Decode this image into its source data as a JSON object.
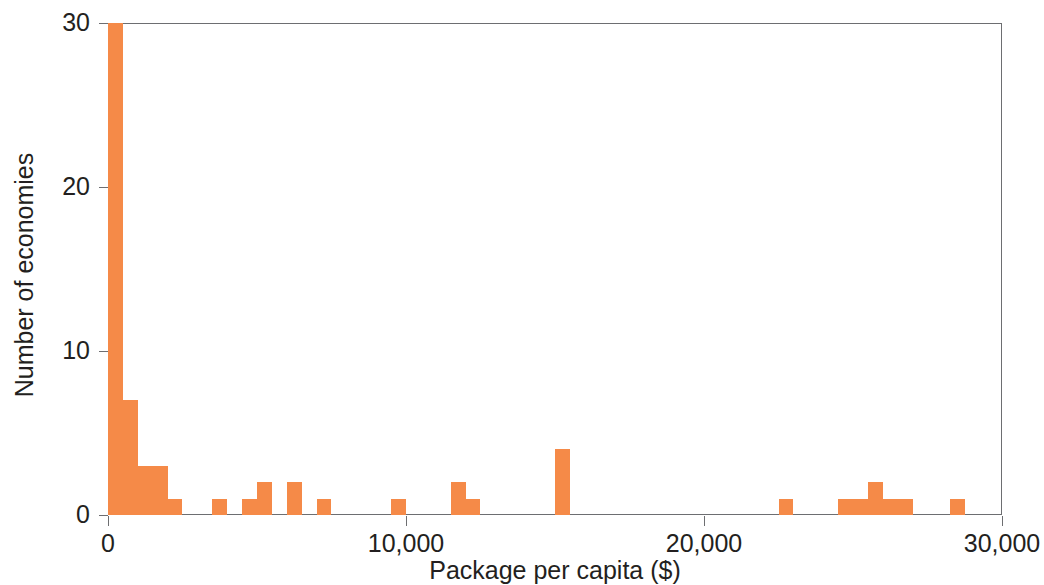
{
  "chart_data": {
    "type": "bar",
    "title": "",
    "subtitle": "",
    "xlabel": "Package per capita ($)",
    "ylabel": "Number of economies",
    "xlim": [
      0,
      30000
    ],
    "ylim": [
      0,
      30
    ],
    "xticks": [
      0,
      10000,
      20000,
      30000
    ],
    "xtick_labels": [
      "0",
      "10,000",
      "20,000",
      "30,000"
    ],
    "yticks": [
      0,
      10,
      20,
      30
    ],
    "ytick_labels": [
      "0",
      "10",
      "20",
      "30"
    ],
    "grid": false,
    "legend": null,
    "bin_width": 500,
    "bar_color": "#f58a48",
    "axis_color": "#6d6e71",
    "text_color": "#231f20",
    "background": "#ffffff",
    "note": "Histogram of economies by size of fiscal package per capita in US dollars; bins are 500 dollars wide.",
    "bins": [
      {
        "x0": 0,
        "x1": 500,
        "count": 30
      },
      {
        "x0": 500,
        "x1": 1000,
        "count": 7
      },
      {
        "x0": 1000,
        "x1": 1500,
        "count": 3
      },
      {
        "x0": 1500,
        "x1": 2000,
        "count": 3
      },
      {
        "x0": 2000,
        "x1": 2500,
        "count": 1
      },
      {
        "x0": 3500,
        "x1": 4000,
        "count": 1
      },
      {
        "x0": 4500,
        "x1": 5000,
        "count": 1
      },
      {
        "x0": 5000,
        "x1": 5500,
        "count": 2
      },
      {
        "x0": 6000,
        "x1": 6500,
        "count": 2
      },
      {
        "x0": 7000,
        "x1": 7500,
        "count": 1
      },
      {
        "x0": 9500,
        "x1": 10000,
        "count": 1
      },
      {
        "x0": 11500,
        "x1": 12000,
        "count": 2
      },
      {
        "x0": 12000,
        "x1": 12500,
        "count": 1
      },
      {
        "x0": 15000,
        "x1": 15500,
        "count": 4
      },
      {
        "x0": 22500,
        "x1": 23000,
        "count": 1
      },
      {
        "x0": 24500,
        "x1": 25000,
        "count": 1
      },
      {
        "x0": 25000,
        "x1": 25500,
        "count": 1
      },
      {
        "x0": 25500,
        "x1": 26000,
        "count": 2
      },
      {
        "x0": 26000,
        "x1": 26500,
        "count": 1
      },
      {
        "x0": 26500,
        "x1": 27000,
        "count": 1
      },
      {
        "x0": 28250,
        "x1": 28750,
        "count": 1
      }
    ]
  }
}
